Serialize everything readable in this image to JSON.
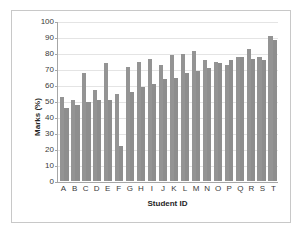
{
  "chart_data": {
    "type": "bar",
    "title": "",
    "xlabel": "Student ID",
    "ylabel": "Marks (%)",
    "ylim": [
      0,
      100
    ],
    "ytick_step": 10,
    "yticks": [
      0,
      10,
      20,
      30,
      40,
      50,
      60,
      70,
      80,
      90,
      100
    ],
    "grid": true,
    "legend": "none",
    "categories": [
      "A",
      "B",
      "C",
      "D",
      "E",
      "F",
      "G",
      "H",
      "I",
      "J",
      "K",
      "L",
      "M",
      "N",
      "O",
      "P",
      "Q",
      "R",
      "S",
      "T"
    ],
    "series": [
      {
        "name": "Series 1",
        "values": [
          53,
          51,
          68,
          57,
          74,
          55,
          72,
          75,
          77,
          73,
          79,
          80,
          82,
          76,
          75,
          73,
          78,
          83,
          78,
          91
        ]
      },
      {
        "name": "Series 2",
        "values": [
          46,
          48,
          50,
          51,
          51,
          22,
          56,
          59,
          61,
          64,
          65,
          68,
          69,
          71,
          74,
          76,
          78,
          77,
          76,
          89
        ]
      }
    ],
    "colors": {
      "bar_series_1": "#949494",
      "bar_series_2": "#8e8e8e",
      "gridline": "#e4e4e4",
      "axis": "#a6a6a6",
      "frame": "#c8c8c8",
      "text": "#3a3a3a"
    }
  }
}
